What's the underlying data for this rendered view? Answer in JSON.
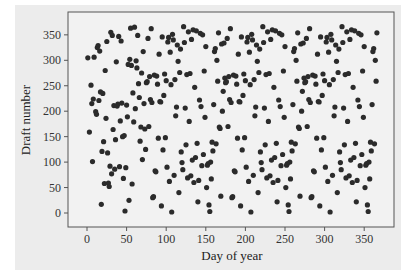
{
  "chart_data": {
    "type": "scatter",
    "title": "",
    "xlabel": "Day of year",
    "ylabel": "Draft number",
    "xlim": [
      -25,
      385
    ],
    "ylim": [
      -28,
      390
    ],
    "xticks": [
      0,
      50,
      100,
      150,
      200,
      250,
      300,
      350
    ],
    "yticks": [
      0,
      50,
      100,
      150,
      200,
      250,
      300,
      350
    ],
    "grid": false,
    "legend": null,
    "marker_color": "#2b2b2b",
    "background_color": "#ececec",
    "points": [
      [
        1,
        305
      ],
      [
        3,
        159
      ],
      [
        5,
        251
      ],
      [
        6,
        215
      ],
      [
        7,
        101
      ],
      [
        8,
        224
      ],
      [
        9,
        306
      ],
      [
        11,
        199
      ],
      [
        12,
        194
      ],
      [
        13,
        325
      ],
      [
        14,
        329
      ],
      [
        15,
        221
      ],
      [
        16,
        318
      ],
      [
        17,
        238
      ],
      [
        18,
        17
      ],
      [
        19,
        121
      ],
      [
        20,
        235
      ],
      [
        21,
        140
      ],
      [
        22,
        58
      ],
      [
        23,
        280
      ],
      [
        24,
        186
      ],
      [
        25,
        337
      ],
      [
        26,
        118
      ],
      [
        27,
        59
      ],
      [
        28,
        52
      ],
      [
        29,
        92
      ],
      [
        30,
        355
      ],
      [
        31,
        77
      ],
      [
        32,
        349
      ],
      [
        33,
        164
      ],
      [
        34,
        211
      ],
      [
        35,
        86
      ],
      [
        36,
        144
      ],
      [
        37,
        297
      ],
      [
        38,
        210
      ],
      [
        39,
        214
      ],
      [
        40,
        347
      ],
      [
        41,
        91
      ],
      [
        42,
        181
      ],
      [
        43,
        338
      ],
      [
        44,
        216
      ],
      [
        45,
        150
      ],
      [
        46,
        68
      ],
      [
        47,
        152
      ],
      [
        48,
        4
      ],
      [
        49,
        89
      ],
      [
        50,
        212
      ],
      [
        51,
        189
      ],
      [
        52,
        292
      ],
      [
        53,
        25
      ],
      [
        54,
        302
      ],
      [
        55,
        363
      ],
      [
        56,
        290
      ],
      [
        57,
        57
      ],
      [
        58,
        236
      ],
      [
        59,
        179
      ],
      [
        60,
        365
      ],
      [
        61,
        205
      ],
      [
        62,
        299
      ],
      [
        63,
        285
      ],
      [
        64,
        349
      ],
      [
        65,
        254
      ],
      [
        66,
        227
      ],
      [
        67,
        141
      ],
      [
        68,
        169
      ],
      [
        69,
        275
      ],
      [
        70,
        105
      ],
      [
        71,
        317
      ],
      [
        72,
        215
      ],
      [
        73,
        165
      ],
      [
        74,
        125
      ],
      [
        75,
        256
      ],
      [
        76,
        258
      ],
      [
        77,
        343
      ],
      [
        78,
        170
      ],
      [
        79,
        268
      ],
      [
        80,
        223
      ],
      [
        81,
        362
      ],
      [
        82,
        217
      ],
      [
        83,
        30
      ],
      [
        84,
        32
      ],
      [
        85,
        271
      ],
      [
        86,
        83
      ],
      [
        87,
        81
      ],
      [
        88,
        269
      ],
      [
        89,
        253
      ],
      [
        90,
        147
      ],
      [
        91,
        312
      ],
      [
        92,
        219
      ],
      [
        93,
        218
      ],
      [
        94,
        14
      ],
      [
        95,
        346
      ],
      [
        96,
        124
      ],
      [
        97,
        231
      ],
      [
        98,
        273
      ],
      [
        99,
        148
      ],
      [
        100,
        260
      ],
      [
        101,
        90
      ],
      [
        102,
        336
      ],
      [
        103,
        345
      ],
      [
        104,
        62
      ],
      [
        105,
        316
      ],
      [
        106,
        252
      ],
      [
        107,
        2
      ],
      [
        108,
        351
      ],
      [
        109,
        340
      ],
      [
        110,
        74
      ],
      [
        111,
        262
      ],
      [
        112,
        191
      ],
      [
        113,
        208
      ],
      [
        114,
        330
      ],
      [
        115,
        298
      ],
      [
        116,
        40
      ],
      [
        117,
        276
      ],
      [
        118,
        322
      ],
      [
        119,
        120
      ],
      [
        120,
        99
      ],
      [
        121,
        85
      ],
      [
        122,
        366
      ],
      [
        123,
        335
      ],
      [
        124,
        206
      ],
      [
        125,
        134
      ],
      [
        126,
        272
      ],
      [
        127,
        69
      ],
      [
        128,
        356
      ],
      [
        129,
        180
      ],
      [
        130,
        274
      ],
      [
        131,
        73
      ],
      [
        132,
        341
      ],
      [
        133,
        104
      ],
      [
        134,
        360
      ],
      [
        135,
        60
      ],
      [
        136,
        247
      ],
      [
        137,
        109
      ],
      [
        138,
        358
      ],
      [
        139,
        137
      ],
      [
        140,
        22
      ],
      [
        141,
        64
      ],
      [
        142,
        222
      ],
      [
        143,
        353
      ],
      [
        144,
        209
      ],
      [
        145,
        93
      ],
      [
        146,
        350
      ],
      [
        147,
        115
      ],
      [
        148,
        279
      ],
      [
        149,
        188
      ],
      [
        150,
        327
      ],
      [
        151,
        50
      ],
      [
        152,
        94
      ],
      [
        153,
        97
      ],
      [
        154,
        16
      ],
      [
        155,
        3
      ],
      [
        156,
        100
      ],
      [
        157,
        67
      ],
      [
        158,
        139
      ],
      [
        159,
        122
      ],
      [
        160,
        213
      ],
      [
        161,
        317
      ],
      [
        162,
        323
      ],
      [
        163,
        136
      ],
      [
        164,
        300
      ],
      [
        165,
        259
      ],
      [
        166,
        354
      ],
      [
        167,
        169
      ],
      [
        168,
        166
      ],
      [
        169,
        33
      ],
      [
        170,
        332
      ],
      [
        171,
        200
      ],
      [
        172,
        239
      ],
      [
        173,
        334
      ],
      [
        174,
        265
      ],
      [
        175,
        256
      ],
      [
        176,
        258
      ],
      [
        177,
        343
      ],
      [
        178,
        170
      ],
      [
        179,
        268
      ],
      [
        180,
        223
      ],
      [
        181,
        362
      ],
      [
        182,
        217
      ],
      [
        183,
        30
      ],
      [
        184,
        32
      ],
      [
        185,
        271
      ],
      [
        186,
        83
      ],
      [
        187,
        81
      ],
      [
        188,
        269
      ],
      [
        189,
        253
      ],
      [
        190,
        147
      ],
      [
        191,
        312
      ],
      [
        192,
        219
      ],
      [
        193,
        218
      ],
      [
        194,
        14
      ],
      [
        195,
        346
      ],
      [
        196,
        124
      ],
      [
        197,
        231
      ],
      [
        198,
        273
      ],
      [
        199,
        148
      ],
      [
        200,
        260
      ],
      [
        201,
        90
      ],
      [
        202,
        336
      ],
      [
        203,
        345
      ],
      [
        204,
        62
      ],
      [
        205,
        316
      ],
      [
        206,
        252
      ],
      [
        207,
        2
      ],
      [
        208,
        351
      ],
      [
        209,
        340
      ],
      [
        210,
        74
      ],
      [
        211,
        262
      ],
      [
        212,
        191
      ],
      [
        213,
        208
      ],
      [
        214,
        330
      ],
      [
        215,
        298
      ],
      [
        216,
        40
      ],
      [
        217,
        276
      ],
      [
        218,
        322
      ],
      [
        219,
        120
      ],
      [
        220,
        99
      ],
      [
        221,
        85
      ],
      [
        222,
        366
      ],
      [
        223,
        335
      ],
      [
        224,
        206
      ],
      [
        225,
        134
      ],
      [
        226,
        272
      ],
      [
        227,
        69
      ],
      [
        228,
        356
      ],
      [
        229,
        180
      ],
      [
        230,
        274
      ],
      [
        231,
        73
      ],
      [
        232,
        341
      ],
      [
        233,
        104
      ],
      [
        234,
        360
      ],
      [
        235,
        60
      ],
      [
        236,
        247
      ],
      [
        237,
        109
      ],
      [
        238,
        358
      ],
      [
        239,
        137
      ],
      [
        240,
        22
      ],
      [
        241,
        64
      ],
      [
        242,
        222
      ],
      [
        243,
        353
      ],
      [
        244,
        209
      ],
      [
        245,
        93
      ],
      [
        246,
        350
      ],
      [
        247,
        115
      ],
      [
        248,
        279
      ],
      [
        249,
        188
      ],
      [
        250,
        327
      ],
      [
        251,
        50
      ],
      [
        252,
        94
      ],
      [
        253,
        97
      ],
      [
        254,
        16
      ],
      [
        255,
        3
      ],
      [
        256,
        100
      ],
      [
        257,
        67
      ],
      [
        258,
        139
      ],
      [
        259,
        122
      ],
      [
        260,
        213
      ],
      [
        261,
        317
      ],
      [
        262,
        323
      ],
      [
        263,
        136
      ],
      [
        264,
        300
      ],
      [
        265,
        259
      ],
      [
        266,
        354
      ],
      [
        267,
        169
      ],
      [
        268,
        166
      ],
      [
        269,
        33
      ],
      [
        270,
        332
      ],
      [
        271,
        200
      ],
      [
        272,
        239
      ],
      [
        273,
        334
      ],
      [
        274,
        265
      ],
      [
        275,
        256
      ],
      [
        276,
        258
      ],
      [
        277,
        343
      ],
      [
        278,
        170
      ],
      [
        279,
        268
      ],
      [
        280,
        223
      ],
      [
        281,
        362
      ],
      [
        282,
        217
      ],
      [
        283,
        30
      ],
      [
        284,
        32
      ],
      [
        285,
        271
      ],
      [
        286,
        83
      ],
      [
        287,
        81
      ],
      [
        288,
        269
      ],
      [
        289,
        253
      ],
      [
        290,
        147
      ],
      [
        291,
        312
      ],
      [
        292,
        219
      ],
      [
        293,
        218
      ],
      [
        294,
        14
      ],
      [
        295,
        346
      ],
      [
        296,
        124
      ],
      [
        297,
        231
      ],
      [
        298,
        273
      ],
      [
        299,
        148
      ],
      [
        300,
        260
      ],
      [
        301,
        90
      ],
      [
        302,
        336
      ],
      [
        303,
        345
      ],
      [
        304,
        62
      ],
      [
        305,
        316
      ],
      [
        306,
        252
      ],
      [
        307,
        2
      ],
      [
        308,
        351
      ],
      [
        309,
        340
      ],
      [
        310,
        74
      ],
      [
        311,
        262
      ],
      [
        312,
        191
      ],
      [
        313,
        208
      ],
      [
        314,
        330
      ],
      [
        315,
        298
      ],
      [
        316,
        40
      ],
      [
        317,
        276
      ],
      [
        318,
        322
      ],
      [
        319,
        120
      ],
      [
        320,
        99
      ],
      [
        321,
        85
      ],
      [
        322,
        366
      ],
      [
        323,
        335
      ],
      [
        324,
        206
      ],
      [
        325,
        134
      ],
      [
        326,
        272
      ],
      [
        327,
        69
      ],
      [
        328,
        356
      ],
      [
        329,
        180
      ],
      [
        330,
        274
      ],
      [
        331,
        73
      ],
      [
        332,
        341
      ],
      [
        333,
        104
      ],
      [
        334,
        360
      ],
      [
        335,
        60
      ],
      [
        336,
        247
      ],
      [
        337,
        109
      ],
      [
        338,
        358
      ],
      [
        339,
        137
      ],
      [
        340,
        22
      ],
      [
        341,
        64
      ],
      [
        342,
        222
      ],
      [
        343,
        353
      ],
      [
        344,
        209
      ],
      [
        345,
        93
      ],
      [
        346,
        350
      ],
      [
        347,
        115
      ],
      [
        348,
        279
      ],
      [
        349,
        188
      ],
      [
        350,
        327
      ],
      [
        351,
        50
      ],
      [
        352,
        94
      ],
      [
        353,
        97
      ],
      [
        354,
        16
      ],
      [
        355,
        3
      ],
      [
        356,
        100
      ],
      [
        357,
        67
      ],
      [
        358,
        139
      ],
      [
        359,
        122
      ],
      [
        360,
        213
      ],
      [
        361,
        317
      ],
      [
        362,
        323
      ],
      [
        363,
        136
      ],
      [
        364,
        300
      ],
      [
        365,
        259
      ],
      [
        366,
        354
      ]
    ]
  }
}
